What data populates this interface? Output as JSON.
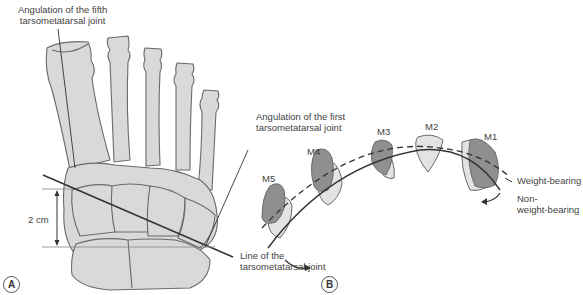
{
  "panel_a": {
    "tag": "A",
    "labels": {
      "fifth_angle_line1": "Angulation of the fifth",
      "fifth_angle_line2": "tarsometatarsal joint",
      "first_angle_line1": "Angulation of the first",
      "first_angle_line2": "tarsometatarsal joint",
      "joint_line1": "Line of the",
      "joint_line2": "tarsometatarsal joint",
      "distance": "2 cm"
    }
  },
  "panel_b": {
    "tag": "B",
    "metatarsals": [
      "M5",
      "M4",
      "M3",
      "M2",
      "M1"
    ],
    "legend": {
      "weight_bearing": "Weight-bearing",
      "non_weight_bearing_line1": "Non-",
      "non_weight_bearing_line2": "weight-bearing"
    }
  },
  "colors": {
    "bone_fill": "#d9d9d9",
    "bone_outline": "#6a6a6a",
    "dark_fill": "#8f8f8f",
    "light_fill": "#e3e3e3",
    "line": "#333333"
  }
}
